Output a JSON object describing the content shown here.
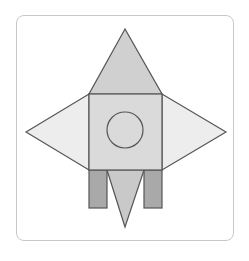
{
  "figure": {
    "title": "Rocket made of geometric shapes",
    "colors": {
      "stroke": "#555555",
      "nose_cone": "#d0d0d0",
      "body": "#dadada",
      "wings": "#ededed",
      "legs": "#a9a9a9",
      "exhaust": "#c9c9c9",
      "window": "#dadada",
      "frame_border": "#c8c8c8"
    },
    "shapes": {
      "nose_cone": {
        "type": "triangle",
        "points": "125,29 89,94 162,94"
      },
      "left_wing": {
        "type": "triangle",
        "points": "26,132 89,94 89,170"
      },
      "right_wing": {
        "type": "triangle",
        "points": "226,132 162,94 162,170"
      },
      "body": {
        "type": "square",
        "x": 89,
        "y": 94,
        "width": 73,
        "height": 76
      },
      "window": {
        "type": "circle",
        "cx": 125,
        "cy": 130,
        "r": 18
      },
      "left_leg": {
        "type": "rectangle",
        "x": 89,
        "y": 170,
        "width": 18,
        "height": 38
      },
      "right_leg": {
        "type": "rectangle",
        "x": 144,
        "y": 170,
        "width": 18,
        "height": 38
      },
      "exhaust": {
        "type": "triangle",
        "points": "107,170 144,170 125,227"
      }
    }
  }
}
